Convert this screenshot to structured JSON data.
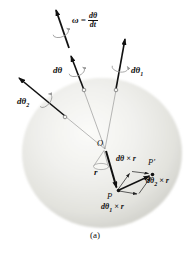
{
  "figure": {
    "caption": "(a)",
    "labels": {
      "omega_lhs": "ω =",
      "omega_num": "dθ",
      "omega_den": "dt",
      "dtheta": "dθ",
      "dtheta1": {
        "base": "dθ",
        "sub": "1"
      },
      "dtheta2": {
        "base": "dθ",
        "sub": "2"
      },
      "origin": "O",
      "r_vector": "r",
      "point_p": "P",
      "point_p_prime": "P′",
      "dtheta_cross_r": "dθ × r",
      "dtheta1_cross_r": {
        "pre": "dθ",
        "sub": "1",
        "post": " × r"
      },
      "dtheta2_cross_r": {
        "pre": "dθ",
        "sub": "2",
        "post": " × r"
      }
    },
    "icons": {
      "rotation_loop": "elliptical-arc-arrow"
    },
    "colors": {
      "background": "#ffffff",
      "sphere_highlight": "#fbfbf9",
      "sphere_edge": "#d0d0ca",
      "vector": "#111111",
      "thin_line": "#8a8a8a",
      "loop": "#999999",
      "text": "#111111"
    }
  }
}
